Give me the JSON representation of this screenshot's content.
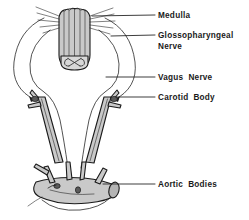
{
  "figure": {
    "background_color": "#ffffff",
    "ink_color": "#1a1a1a",
    "vessel_shade_color": "#c9c9c9",
    "nodule_color": "#5a5a5a",
    "width": 249,
    "height": 220
  },
  "labels": [
    {
      "id": "medulla",
      "text": "Medulla",
      "line2": "",
      "x": 158,
      "y": 18
    },
    {
      "id": "glossopharyngeal-nerve",
      "text": "Glossopharyngeal",
      "line2": "Nerve",
      "x": 158,
      "y": 38
    },
    {
      "id": "vagus-nerve",
      "text": "Vagus  Nerve",
      "line2": "",
      "x": 158,
      "y": 80
    },
    {
      "id": "carotid-body",
      "text": "Carotid  Body",
      "line2": "",
      "x": 158,
      "y": 100
    },
    {
      "id": "aortic-bodies",
      "text": "Aortic  Bodies",
      "line2": "",
      "x": 158,
      "y": 187
    }
  ],
  "structures": [
    {
      "id": "medulla",
      "name": "Medulla oblongata",
      "note": "vertical shaded column with longitudinal striations and rootlets"
    },
    {
      "id": "spinal-cord-cap",
      "name": "Spinal cord cross-section",
      "note": "rounded cap with butterfly gray matter pattern"
    },
    {
      "id": "glossopharyngeal-nerve",
      "name": "Glossopharyngeal nerve",
      "note": "thin outer looping nerve to carotid body"
    },
    {
      "id": "vagus-nerve",
      "name": "Vagus nerve",
      "note": "inner looping nerve descending to aortic bodies"
    },
    {
      "id": "carotid-body-left",
      "name": "Left carotid body",
      "note": "nodule at carotid bifurcation"
    },
    {
      "id": "carotid-body-right",
      "name": "Right carotid body",
      "note": "nodule at carotid bifurcation"
    },
    {
      "id": "carotid-artery-left",
      "name": "Left common carotid artery",
      "note": "shaded vessel"
    },
    {
      "id": "carotid-artery-right",
      "name": "Right common carotid artery",
      "note": "shaded vessel"
    },
    {
      "id": "aortic-arch",
      "name": "Aortic arch",
      "note": "shaded arch with branching great vessels"
    },
    {
      "id": "aortic-bodies",
      "name": "Aortic bodies",
      "note": "small nodules on the aortic arch"
    }
  ]
}
